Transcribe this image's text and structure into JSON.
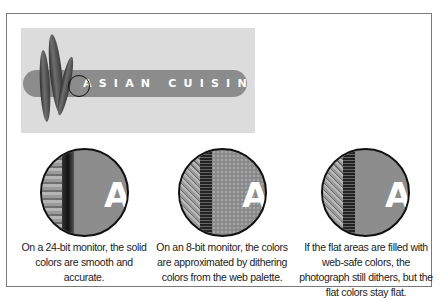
{
  "logo": {
    "title": "SIAN CUISINE",
    "first_letter": "A",
    "full_text": "ASIAN CUISINE",
    "colors": {
      "panel": "#dcdcdc",
      "bar": "#8c8c8c",
      "text": "#ffffff"
    }
  },
  "panels": [
    {
      "id": "24bit",
      "letter": "A",
      "caption": "On a 24-bit monitor, the solid colors are smooth and accurate."
    },
    {
      "id": "8bit",
      "letter": "A",
      "caption": "On an 8-bit monitor, the colors are approximated by dithering colors from the web palette."
    },
    {
      "id": "websafe",
      "letter": "A",
      "caption": "If the flat areas are filled with web-safe colors, the photograph still dithers, but the flat colors stay flat."
    }
  ]
}
